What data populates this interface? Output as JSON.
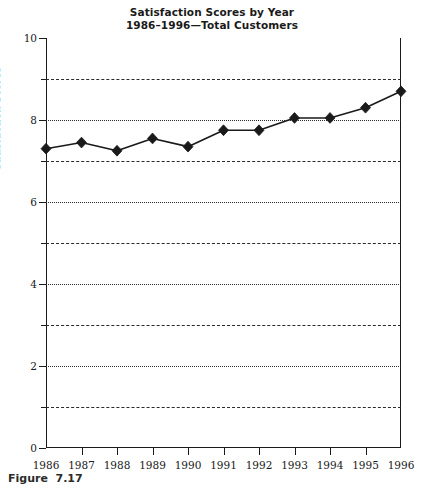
{
  "chart_data": {
    "type": "line",
    "title": "Satisfaction Scores by Year",
    "subtitle": "1986–1996—Total Customers",
    "xlabel": "",
    "ylabel": "Satisfaction Scores",
    "categories": [
      "1986",
      "1987",
      "1988",
      "1989",
      "1990",
      "1991",
      "1992",
      "1993",
      "1994",
      "1995",
      "1996"
    ],
    "values": [
      7.3,
      7.45,
      7.25,
      7.55,
      7.35,
      7.75,
      7.75,
      8.05,
      8.05,
      8.3,
      8.7
    ],
    "series": [
      {
        "name": "Total Customers",
        "values": [
          7.3,
          7.45,
          7.25,
          7.55,
          7.35,
          7.75,
          7.75,
          8.05,
          8.05,
          8.3,
          8.7
        ]
      }
    ],
    "ylim": [
      0,
      10
    ],
    "y_major_ticks": [
      0,
      2,
      4,
      6,
      8,
      10
    ],
    "y_minor_ticks": [
      1,
      3,
      5,
      7,
      9
    ],
    "y_tick_labels": [
      "0",
      "2",
      "4",
      "6",
      "8",
      "10"
    ],
    "gridlines": {
      "visible": true,
      "dashed_at": [
        1,
        3,
        5,
        7,
        9
      ],
      "dotted_at": [
        2,
        4,
        6,
        8
      ]
    },
    "legend": {
      "visible": false,
      "position": "none"
    },
    "marker": "diamond",
    "line_color": "#1a1a1a",
    "marker_color": "#1a1a1a"
  },
  "caption": {
    "text": "Figure  7.17"
  }
}
